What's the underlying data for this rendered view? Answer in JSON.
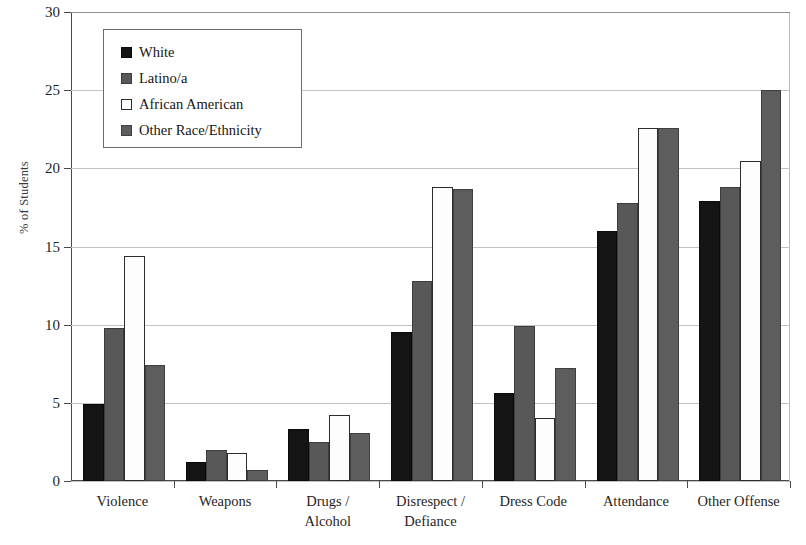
{
  "chart_data": {
    "type": "bar",
    "title": "",
    "subtitle": "",
    "xlabel": "",
    "ylabel": "% of Students",
    "ylim": [
      0,
      30
    ],
    "ytick_step": 5,
    "ytick_labels": [
      "0",
      "5",
      "10",
      "15",
      "20",
      "25",
      "30"
    ],
    "grid": true,
    "legend_position": "upper-left-inside",
    "categories": [
      "Violence",
      "Weapons",
      "Drugs /\nAlcohol",
      "Disrespect /\nDefiance",
      "Dress Code",
      "Attendance",
      "Other Offense"
    ],
    "series": [
      {
        "name": "White",
        "color": "#141414",
        "values": [
          4.9,
          1.2,
          3.3,
          9.5,
          5.6,
          16.0,
          17.9
        ]
      },
      {
        "name": "Latino/a",
        "color": "#585858",
        "values": [
          9.8,
          2.0,
          2.5,
          12.8,
          9.9,
          17.8,
          18.8
        ]
      },
      {
        "name": "African American",
        "color": "#ffffff",
        "values": [
          14.4,
          1.8,
          4.2,
          18.8,
          4.0,
          22.6,
          20.5
        ]
      },
      {
        "name": "Other Race/Ethnicity",
        "color": "#5d5d5d",
        "values": [
          7.4,
          0.7,
          3.1,
          18.7,
          7.2,
          22.6,
          25.0
        ]
      }
    ]
  },
  "legend": {
    "items": [
      {
        "label": "White"
      },
      {
        "label": "Latino/a"
      },
      {
        "label": "African American"
      },
      {
        "label": "Other Race/Ethnicity"
      }
    ]
  }
}
